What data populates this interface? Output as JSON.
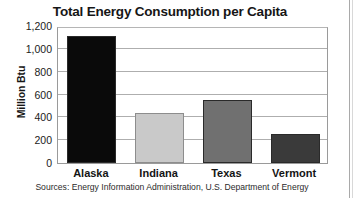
{
  "chart_data": {
    "type": "bar",
    "title": "Total Energy Consumption per Capita",
    "xlabel": "",
    "ylabel": "Million Btu",
    "categories": [
      "Alaska",
      "Indiana",
      "Texas",
      "Vermont"
    ],
    "values": [
      1110,
      440,
      550,
      250
    ],
    "ytick_labels": [
      "0",
      "200",
      "400",
      "600",
      "800",
      "1,000",
      "1,200"
    ],
    "ytick_values": [
      0,
      200,
      400,
      600,
      800,
      1000,
      1200
    ],
    "ylim": [
      0,
      1200
    ],
    "grid": "horizontal",
    "legend": "none",
    "bar_colors": [
      "#0a0a0a",
      "#c9c9c9",
      "#707070",
      "#3a3a3a"
    ],
    "source_note": "Sources: Energy Information Administration, U.S. Department of Energy"
  }
}
